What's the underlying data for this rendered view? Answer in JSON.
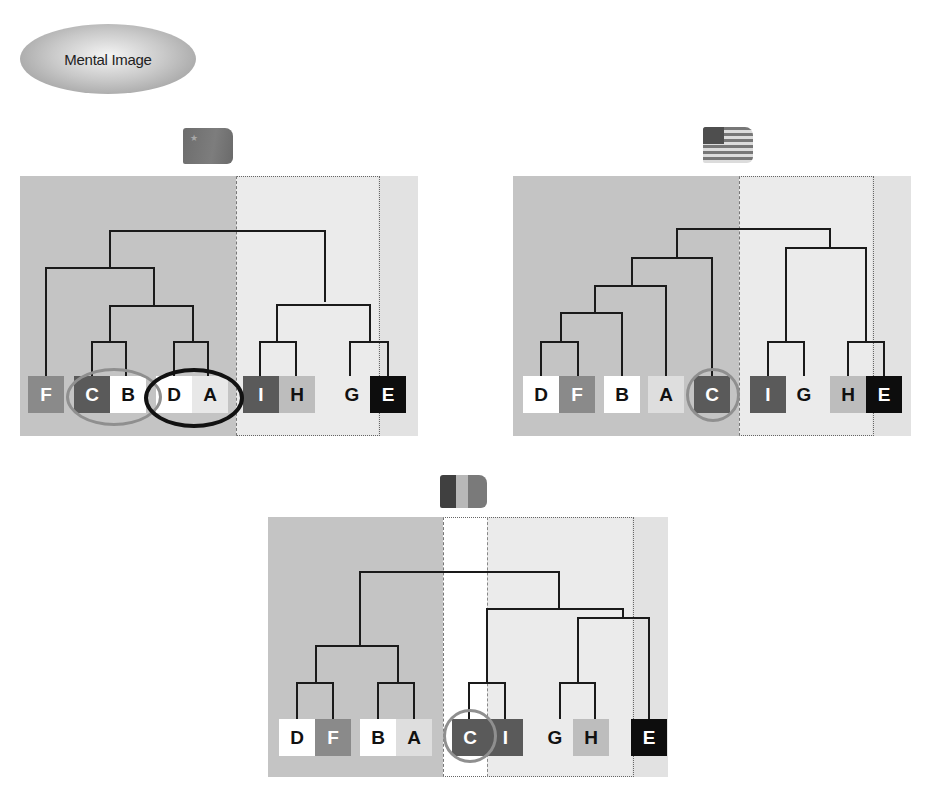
{
  "title": {
    "label": "Mental Image"
  },
  "colors": {
    "group_left_bg": "#c4c4c4",
    "group_right_bg": "#ebebeb",
    "outer_right_bg": "#e2e2e2",
    "line": "#1a1a1a",
    "leaf_dark": "#5a5a5a",
    "leaf_mid": "#8a8a8a",
    "leaf_light": "#bdbdbd",
    "leaf_white": "#ffffff",
    "leaf_black": "#0d0d0d",
    "circle_gray": "#8f8f8f",
    "circle_black": "#111111"
  },
  "panels": [
    {
      "id": "china",
      "flag": "china-flag",
      "leaves": [
        "F",
        "C",
        "B",
        "D",
        "A",
        "I",
        "H",
        "G",
        "E"
      ],
      "highlights": [
        {
          "type": "gray-ellipse",
          "around": [
            "C",
            "B"
          ]
        },
        {
          "type": "black-ellipse",
          "around": [
            "D",
            "A"
          ]
        }
      ]
    },
    {
      "id": "usa",
      "flag": "usa-flag",
      "leaves": [
        "D",
        "F",
        "B",
        "A",
        "C",
        "I",
        "G",
        "H",
        "E"
      ],
      "highlights": [
        {
          "type": "gray-circle",
          "around": [
            "C"
          ]
        }
      ]
    },
    {
      "id": "france",
      "flag": "france-flag",
      "leaves": [
        "D",
        "F",
        "B",
        "A",
        "C",
        "I",
        "G",
        "H",
        "E"
      ],
      "highlights": [
        {
          "type": "gray-circle",
          "around": [
            "C"
          ]
        }
      ]
    }
  ]
}
